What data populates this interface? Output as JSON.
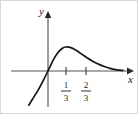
{
  "figure": {
    "kind": "cartesian-function-graph",
    "background_color": "#ffffff",
    "border_color": "#d8d8d8",
    "axis_color": "#555555",
    "curve_color": "#171717",
    "width": 138,
    "height": 114
  },
  "labels": {
    "y_axis_label": "y",
    "x_axis_label": "x"
  },
  "ticks": [
    {
      "numerator": "1",
      "denominator": "3",
      "x_px": 65
    },
    {
      "numerator": "2",
      "denominator": "3",
      "x_px": 85
    }
  ],
  "chart_data": {
    "type": "line",
    "title": "",
    "subtitle": "",
    "xlabel": "x",
    "ylabel": "y",
    "grid": false,
    "legend": null,
    "annotations": [],
    "xtick_labels": [
      "1/3",
      "2/3"
    ],
    "xtick_values": [
      0.3333,
      0.6667
    ],
    "ytick_labels": [],
    "xlim": [
      -0.62,
      1.38
    ],
    "ylim": [
      -0.58,
      0.49
    ],
    "origin_px": {
      "x": 47,
      "y": 70
    },
    "px_per_unit": {
      "x": 60,
      "y": 60
    },
    "series": [
      {
        "name": "curve",
        "x": [
          -0.32,
          -0.24,
          -0.16,
          -0.08,
          0.0,
          0.08,
          0.16,
          0.24,
          0.3,
          0.38,
          0.46,
          0.55,
          0.65,
          0.75,
          0.85,
          0.95,
          1.05,
          1.15,
          1.25
        ],
        "y": [
          -0.57,
          -0.44,
          -0.31,
          -0.16,
          0.0,
          0.17,
          0.3,
          0.38,
          0.4,
          0.39,
          0.35,
          0.29,
          0.22,
          0.16,
          0.11,
          0.07,
          0.04,
          0.02,
          0.01
        ]
      }
    ],
    "features": {
      "x_intercept": 0.0,
      "local_maximum_x": 0.3,
      "local_maximum_y": 0.4,
      "horizontal_asymptote_y": 0.0,
      "behavior_left": "decreasing-steeply-downward",
      "behavior_right": "approaches-x-axis-from-above"
    }
  }
}
